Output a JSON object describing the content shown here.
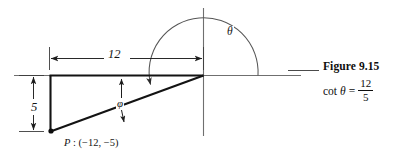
{
  "figure": {
    "dimension_horizontal_label": "12",
    "dimension_vertical_label": "5",
    "angle_theta_label": "θ",
    "angle_phi_label": "φ",
    "point_prefix": "P",
    "point_separator": " : ",
    "point_coordinates": "(−12, −5)",
    "axis_color": "#6b6b6b",
    "triangle_color": "#111111",
    "dimension_color": "#2a2a2a",
    "arc_color": "#4f4f4f"
  },
  "caption": {
    "title": "Figure 9.15",
    "formula_function": "cot",
    "formula_variable": "θ",
    "formula_equals": "=",
    "formula_numerator": "12",
    "formula_denominator": "5"
  }
}
